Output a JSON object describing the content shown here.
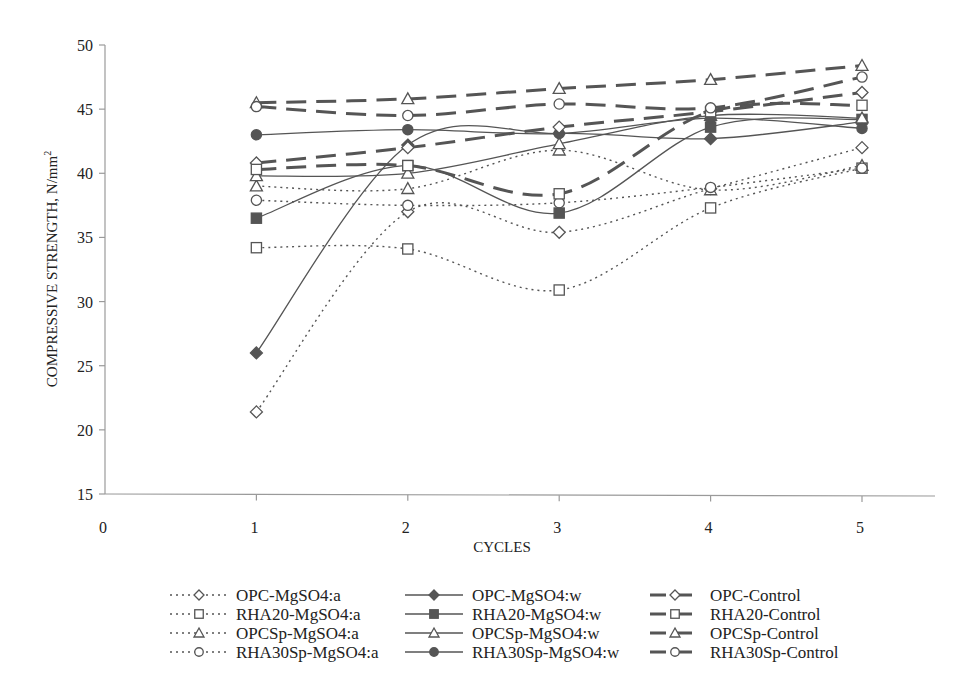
{
  "chart_data": {
    "type": "line",
    "title": "",
    "xlabel": "CYCLES",
    "ylabel": "COMPRESSIVE STRENGTH, N/mm²",
    "ylabel_main": "COMPRESSIVE STRENGTH, N/mm",
    "ylabel_sup": "2",
    "xlim": [
      0,
      5
    ],
    "ylim": [
      15,
      50
    ],
    "xticks": [
      0,
      1,
      2,
      3,
      4,
      5
    ],
    "yticks": [
      15,
      20,
      25,
      30,
      35,
      40,
      45,
      50
    ],
    "grid": false,
    "legend_position": "bottom",
    "x": [
      1,
      2,
      3,
      4,
      5
    ],
    "series": [
      {
        "name": "OPC-MgSO4:a",
        "style": "dotted",
        "marker": "diamond",
        "filled": false,
        "values": [
          21.4,
          37.0,
          35.4,
          38.8,
          42.0
        ]
      },
      {
        "name": "RHA20-MgSO4:a",
        "style": "dotted",
        "marker": "square",
        "filled": false,
        "values": [
          34.2,
          34.1,
          30.9,
          37.3,
          40.4
        ]
      },
      {
        "name": "OPCSp-MgSO4:a",
        "style": "dotted",
        "marker": "triangle",
        "filled": false,
        "values": [
          39.0,
          38.8,
          41.8,
          38.7,
          40.6
        ]
      },
      {
        "name": "RHA30Sp-MgSO4:a",
        "style": "dotted",
        "marker": "circle",
        "filled": false,
        "values": [
          37.9,
          37.5,
          37.7,
          38.9,
          40.4
        ]
      },
      {
        "name": "OPC-MgSO4:w",
        "style": "solid",
        "marker": "diamond",
        "filled": true,
        "values": [
          26.0,
          42.2,
          43.1,
          42.7,
          44.0
        ]
      },
      {
        "name": "RHA20-MgSO4:w",
        "style": "solid",
        "marker": "square",
        "filled": true,
        "values": [
          36.5,
          40.6,
          36.9,
          43.6,
          44.2
        ]
      },
      {
        "name": "OPCSp-MgSO4:w",
        "style": "solid",
        "marker": "triangle",
        "filled": false,
        "values": [
          39.8,
          40.0,
          42.3,
          44.5,
          44.3
        ]
      },
      {
        "name": "RHA30Sp-MgSO4:w",
        "style": "solid",
        "marker": "circle",
        "filled": true,
        "values": [
          43.0,
          43.4,
          43.1,
          44.3,
          43.5
        ]
      },
      {
        "name": "OPC-Control",
        "style": "dashed",
        "marker": "diamond",
        "filled": false,
        "values": [
          40.8,
          42.0,
          43.6,
          44.8,
          46.3
        ]
      },
      {
        "name": "RHA20-Control",
        "style": "dashed",
        "marker": "square",
        "filled": false,
        "values": [
          40.3,
          40.6,
          38.4,
          44.8,
          45.3
        ]
      },
      {
        "name": "OPCSp-Control",
        "style": "dashed",
        "marker": "triangle",
        "filled": false,
        "values": [
          45.5,
          45.8,
          46.6,
          47.3,
          48.4
        ]
      },
      {
        "name": "RHA30Sp-Control",
        "style": "dashed",
        "marker": "circle",
        "filled": false,
        "values": [
          45.2,
          44.5,
          45.4,
          45.1,
          47.5
        ]
      }
    ],
    "colors": {
      "line": "#555555",
      "marker_fill": "#555555",
      "marker_open": "#ffffff",
      "axis": "#9a9a9a",
      "text": "#222222"
    }
  }
}
